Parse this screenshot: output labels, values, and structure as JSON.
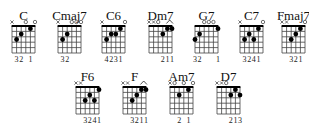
{
  "chart": {
    "string_order": [
      "E",
      "A",
      "D",
      "G",
      "B",
      "e"
    ],
    "frets_shown": 5,
    "colors": {
      "background": "#ffffff",
      "grid": "#444444",
      "nut": "#000000",
      "dot": "#000000",
      "text": "#111111"
    }
  },
  "chords": [
    {
      "name": "C",
      "strings": [
        "x",
        3,
        2,
        0,
        1,
        0
      ],
      "fingers": [
        "",
        "3",
        "2",
        "",
        "1",
        ""
      ],
      "barre": null
    },
    {
      "name": "Cmaj7",
      "strings": [
        "x",
        3,
        2,
        0,
        0,
        0
      ],
      "fingers": [
        "",
        "3",
        "2",
        "",
        "",
        ""
      ],
      "barre": null
    },
    {
      "name": "C6",
      "strings": [
        "x",
        3,
        2,
        2,
        1,
        0
      ],
      "fingers": [
        "",
        "4",
        "2",
        "3",
        "1",
        ""
      ],
      "barre": null
    },
    {
      "name": "Dm7",
      "strings": [
        "x",
        "x",
        0,
        2,
        1,
        1
      ],
      "fingers": [
        "",
        "",
        "",
        "2",
        "1",
        "1"
      ],
      "barre": [
        4,
        5
      ]
    },
    {
      "name": "G7",
      "strings": [
        3,
        2,
        0,
        0,
        0,
        1
      ],
      "fingers": [
        "3",
        "2",
        "",
        "",
        "",
        "1"
      ],
      "barre": null
    },
    {
      "name": "C7",
      "strings": [
        "x",
        3,
        2,
        3,
        1,
        0
      ],
      "fingers": [
        "",
        "3",
        "2",
        "4",
        "1",
        ""
      ],
      "barre": null
    },
    {
      "name": "Fmaj7",
      "strings": [
        "x",
        "x",
        3,
        2,
        1,
        0
      ],
      "fingers": [
        "",
        "",
        "3",
        "2",
        "1",
        ""
      ],
      "barre": null
    },
    {
      "name": "F6",
      "strings": [
        "x",
        "x",
        3,
        2,
        3,
        1
      ],
      "fingers": [
        "",
        "",
        "3",
        "2",
        "4",
        "1"
      ],
      "barre": null
    },
    {
      "name": "F",
      "strings": [
        "x",
        "x",
        3,
        2,
        1,
        1
      ],
      "fingers": [
        "",
        "",
        "3",
        "2",
        "1",
        "1"
      ],
      "barre": [
        4,
        5
      ]
    },
    {
      "name": "Am7",
      "strings": [
        "x",
        0,
        2,
        0,
        1,
        0
      ],
      "fingers": [
        "",
        "",
        "2",
        "",
        "1",
        ""
      ],
      "barre": null
    },
    {
      "name": "D7",
      "strings": [
        "x",
        "x",
        0,
        2,
        1,
        2
      ],
      "fingers": [
        "",
        "",
        "",
        "2",
        "1",
        "3"
      ],
      "barre": null
    }
  ]
}
